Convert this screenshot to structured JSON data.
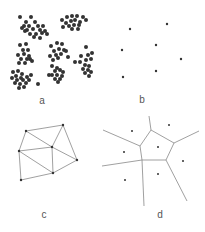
{
  "panels": {
    "a": {
      "label": "a",
      "description": "clustered point set",
      "clusters": [
        [
          [
            20,
            17
          ],
          [
            31,
            17
          ],
          [
            26,
            22
          ],
          [
            35,
            22
          ],
          [
            24,
            26
          ],
          [
            29,
            26
          ],
          [
            38,
            26
          ],
          [
            43,
            26
          ],
          [
            27,
            30
          ],
          [
            33,
            29
          ],
          [
            40,
            30
          ],
          [
            45,
            31
          ],
          [
            30,
            34
          ],
          [
            36,
            34
          ],
          [
            42,
            33
          ],
          [
            34,
            37
          ],
          [
            47,
            34
          ],
          [
            40,
            38
          ],
          [
            25,
            31
          ],
          [
            22,
            28
          ]
        ],
        [
          [
            62,
            20
          ],
          [
            67,
            17
          ],
          [
            72,
            16
          ],
          [
            77,
            16
          ],
          [
            83,
            17
          ],
          [
            66,
            23
          ],
          [
            71,
            21
          ],
          [
            75,
            20
          ],
          [
            80,
            22
          ],
          [
            86,
            20
          ],
          [
            63,
            27
          ],
          [
            69,
            26
          ],
          [
            74,
            25
          ],
          [
            79,
            25
          ],
          [
            72,
            29
          ],
          [
            78,
            29
          ]
        ],
        [
          [
            20,
            45
          ],
          [
            26,
            44
          ],
          [
            23,
            50
          ],
          [
            28,
            50
          ],
          [
            18,
            55
          ],
          [
            24,
            54
          ],
          [
            29,
            56
          ],
          [
            21,
            59
          ],
          [
            27,
            59
          ],
          [
            32,
            61
          ],
          [
            19,
            63
          ],
          [
            25,
            63
          ],
          [
            30,
            59
          ]
        ],
        [
          [
            51,
            46
          ],
          [
            57,
            43
          ],
          [
            62,
            44
          ],
          [
            54,
            51
          ],
          [
            59,
            49
          ],
          [
            64,
            50
          ],
          [
            50,
            56
          ],
          [
            56,
            55
          ],
          [
            61,
            54
          ],
          [
            53,
            60
          ],
          [
            58,
            58
          ],
          [
            66,
            51
          ],
          [
            68,
            57
          ]
        ],
        [
          [
            86,
            47
          ],
          [
            92,
            53
          ],
          [
            88,
            55
          ],
          [
            81,
            56
          ],
          [
            86,
            60
          ],
          [
            91,
            59
          ],
          [
            80,
            62
          ],
          [
            85,
            65
          ],
          [
            89,
            66
          ],
          [
            83,
            69
          ],
          [
            88,
            70
          ],
          [
            91,
            72
          ],
          [
            85,
            73
          ],
          [
            89,
            76
          ],
          [
            75,
            62
          ]
        ],
        [
          [
            52,
            66
          ],
          [
            57,
            68
          ],
          [
            55,
            71
          ],
          [
            60,
            70
          ],
          [
            52,
            75
          ],
          [
            57,
            75
          ],
          [
            62,
            76
          ],
          [
            55,
            79
          ],
          [
            60,
            79
          ],
          [
            63,
            72
          ],
          [
            58,
            82
          ],
          [
            49,
            75
          ]
        ],
        [
          [
            13,
            72
          ],
          [
            18,
            71
          ],
          [
            22,
            74
          ],
          [
            16,
            76
          ],
          [
            21,
            78
          ],
          [
            27,
            77
          ],
          [
            12,
            78
          ],
          [
            17,
            80
          ],
          [
            23,
            80
          ],
          [
            29,
            80
          ],
          [
            15,
            83
          ],
          [
            20,
            84
          ],
          [
            26,
            83
          ],
          [
            24,
            87
          ],
          [
            19,
            88
          ],
          [
            31,
            75
          ],
          [
            38,
            84
          ]
        ]
      ]
    },
    "b": {
      "label": "b",
      "description": "sparse point set (site points)",
      "points": [
        [
          130,
          29
        ],
        [
          167,
          24
        ],
        [
          122,
          50
        ],
        [
          156,
          45
        ],
        [
          181,
          59
        ],
        [
          156,
          71
        ],
        [
          123,
          77
        ]
      ]
    },
    "c": {
      "label": "c",
      "description": "Delaunay triangulation",
      "vertices": [
        [
          26,
          131
        ],
        [
          63,
          125
        ],
        [
          19,
          151
        ],
        [
          52,
          147
        ],
        [
          77,
          160
        ],
        [
          53,
          173
        ],
        [
          21,
          180
        ]
      ],
      "edges": [
        [
          0,
          1
        ],
        [
          1,
          3
        ],
        [
          0,
          3
        ],
        [
          0,
          2
        ],
        [
          2,
          3
        ],
        [
          1,
          4
        ],
        [
          3,
          4
        ],
        [
          2,
          5
        ],
        [
          3,
          5
        ],
        [
          4,
          5
        ],
        [
          2,
          6
        ],
        [
          5,
          6
        ]
      ]
    },
    "d": {
      "label": "d",
      "description": "Voronoi diagram",
      "sites": [
        [
          132,
          131
        ],
        [
          169,
          125
        ],
        [
          124,
          152
        ],
        [
          158,
          147
        ],
        [
          183,
          161
        ],
        [
          158,
          174
        ],
        [
          125,
          180
        ]
      ],
      "cell_vertices": [
        [
          151,
          130
        ],
        [
          174,
          143
        ],
        [
          166,
          160
        ],
        [
          142,
          160
        ],
        [
          140,
          146
        ]
      ],
      "edges": [
        [
          [
            151,
            130
          ],
          [
            174,
            143
          ]
        ],
        [
          [
            174,
            143
          ],
          [
            166,
            160
          ]
        ],
        [
          [
            166,
            160
          ],
          [
            142,
            160
          ]
        ],
        [
          [
            142,
            160
          ],
          [
            140,
            146
          ]
        ],
        [
          [
            140,
            146
          ],
          [
            151,
            130
          ]
        ],
        [
          [
            151,
            130
          ],
          [
            149,
            116
          ]
        ],
        [
          [
            174,
            143
          ],
          [
            199,
            131
          ]
        ],
        [
          [
            166,
            160
          ],
          [
            187,
            201
          ]
        ],
        [
          [
            142,
            160
          ],
          [
            144,
            206
          ]
        ],
        [
          [
            140,
            146
          ],
          [
            103,
            130
          ]
        ],
        [
          [
            142,
            160
          ],
          [
            102,
            166
          ]
        ]
      ]
    }
  },
  "colors": {
    "point": "#333333",
    "line": "#888888",
    "label": "#555555",
    "background": "#ffffff"
  },
  "label_positions": {
    "a": [
      42,
      104
    ],
    "b": [
      142,
      103
    ],
    "c": [
      44,
      218
    ],
    "d": [
      160,
      218
    ]
  }
}
